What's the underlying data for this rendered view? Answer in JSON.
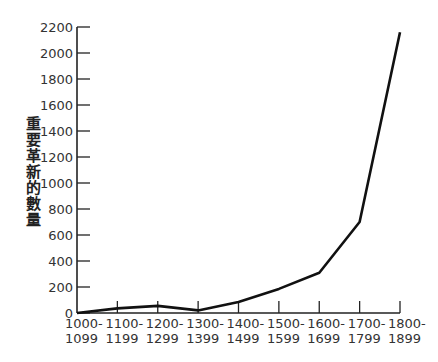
{
  "chart_data": {
    "type": "line",
    "title": "",
    "xlabel": "",
    "ylabel": "重要革新的數量",
    "categories": [
      "1000-1099",
      "1100-1199",
      "1200-1299",
      "1300-1399",
      "1400-1499",
      "1500-1599",
      "1600-1699",
      "1700-1799",
      "1800-1899"
    ],
    "category_lines": [
      [
        "1000-",
        "1099"
      ],
      [
        "1100-",
        "1199"
      ],
      [
        "1200-",
        "1299"
      ],
      [
        "1300-",
        "1399"
      ],
      [
        "1400-",
        "1499"
      ],
      [
        "1500-",
        "1599"
      ],
      [
        "1600-",
        "1699"
      ],
      [
        "1700-",
        "1799"
      ],
      [
        "1800-",
        "1899"
      ]
    ],
    "values": [
      0,
      35,
      55,
      20,
      85,
      185,
      310,
      700,
      2160
    ],
    "ylim": [
      0,
      2200
    ],
    "yticks": [
      0,
      200,
      400,
      600,
      800,
      1000,
      1200,
      1400,
      1600,
      1800,
      2000,
      2200
    ],
    "grid": false,
    "legend": null,
    "line_color": "#111111"
  }
}
